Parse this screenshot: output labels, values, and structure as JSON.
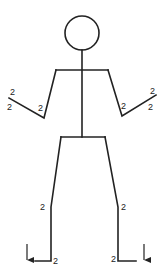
{
  "figure": {
    "stroke_color": "#222222",
    "labels": {
      "left_hand_upper": "2",
      "left_hand_lower": "2",
      "left_elbow": "2",
      "right_elbow": "2",
      "right_hand_upper": "2",
      "right_hand_lower": "2",
      "left_knee": "2",
      "right_knee": "2",
      "left_ankle": "2",
      "right_ankle": "2"
    },
    "arrows": [
      {
        "side": "left",
        "direction": "down"
      },
      {
        "side": "right",
        "direction": "down"
      }
    ]
  }
}
